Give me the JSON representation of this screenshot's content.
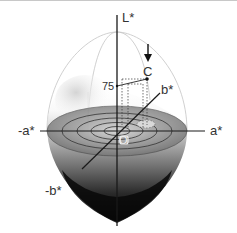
{
  "diagram": {
    "axes": {
      "l_label": "L*",
      "a_pos_label": "a*",
      "a_neg_label": "-a*",
      "b_pos_label": "b*",
      "b_neg_label": "-b*"
    },
    "points": {
      "origin_label": "O",
      "color_point_label": "C",
      "lightness_value_label": "75"
    },
    "colors": {
      "axis": "#1a1a1a",
      "solid_dark": "#0a0a0a",
      "solid_light": "#e8e8e8",
      "disk": "#7a7a7a",
      "wire": "#bdbdbd"
    }
  }
}
